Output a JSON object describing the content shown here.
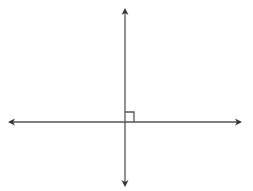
{
  "diagram": {
    "lines": [
      {
        "name": "horizontal-line",
        "x1": 12,
        "y1": 122,
        "x2": 238,
        "y2": 122
      },
      {
        "name": "vertical-line",
        "x1": 125,
        "y1": 12,
        "x2": 125,
        "y2": 183
      }
    ],
    "right_angle_marker": {
      "x": 125,
      "y": 112,
      "size": 9
    },
    "stroke_color": "#555555"
  }
}
